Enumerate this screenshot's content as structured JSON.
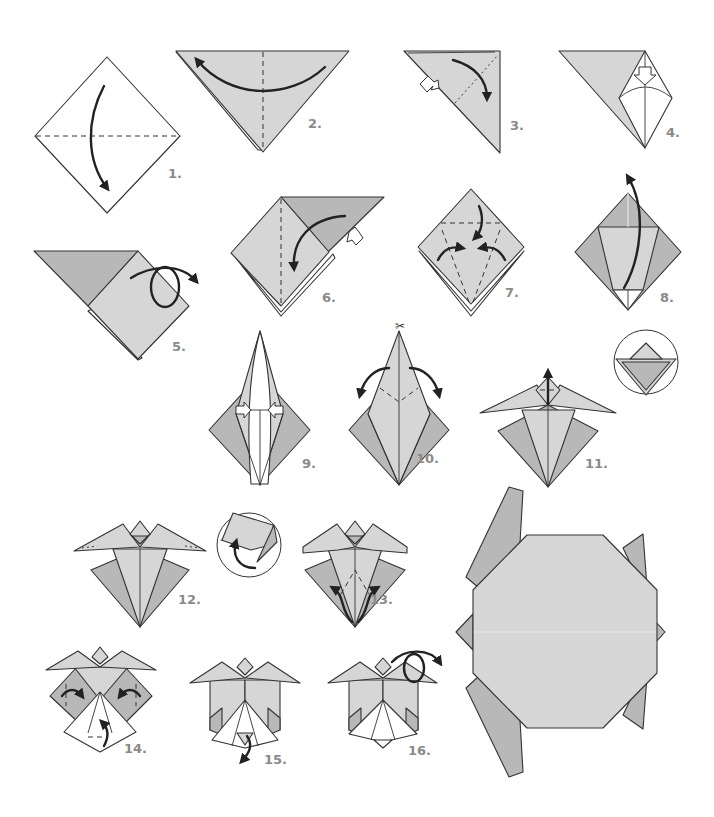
{
  "colors": {
    "paper_white": "#ffffff",
    "paper_light": "#d6d6d6",
    "paper_mid": "#b8b8b8",
    "line": "#333333",
    "label": "#8a8a8a"
  },
  "steps": [
    {
      "number": 1,
      "label": "1.",
      "action": "valley fold top corner down to bottom along horizontal diagonal"
    },
    {
      "number": 2,
      "label": "2.",
      "action": "fold right corner to left along vertical center crease"
    },
    {
      "number": 3,
      "label": "3.",
      "action": "valley fold top corner down, open pocket"
    },
    {
      "number": 4,
      "label": "4.",
      "action": "squash fold downward"
    },
    {
      "number": 5,
      "label": "5.",
      "action": "turn over"
    },
    {
      "number": 6,
      "label": "6.",
      "action": "fold flap down and squash"
    },
    {
      "number": 7,
      "label": "7.",
      "action": "fold top down, fold sides to center"
    },
    {
      "number": 8,
      "label": "8.",
      "action": "petal fold upward"
    },
    {
      "number": 9,
      "label": "9.",
      "action": "narrow the point, push sides in"
    },
    {
      "number": 10,
      "label": "10.",
      "action": "cut top layer, fold flaps outward"
    },
    {
      "number": 11,
      "label": "11.",
      "action": "fold small tip up and down (detail circle)"
    },
    {
      "number": 12,
      "label": "12.",
      "action": "fold flipper tips under (detail circle)"
    },
    {
      "number": 13,
      "label": "13.",
      "action": "fold inner flaps outward"
    },
    {
      "number": 14,
      "label": "14.",
      "action": "fold sides in, fold bottom tip up"
    },
    {
      "number": 15,
      "label": "15.",
      "action": "fold tip down"
    },
    {
      "number": 16,
      "label": "16.",
      "action": "turn over"
    }
  ],
  "final": {
    "label": "finished turtle",
    "shape": "octagon shell with four flippers, head and tail"
  },
  "icons": [
    "curved-arrow-icon",
    "hollow-push-arrow-icon",
    "turn-over-loop-icon",
    "scissors-icon",
    "detail-magnifier-circle"
  ]
}
